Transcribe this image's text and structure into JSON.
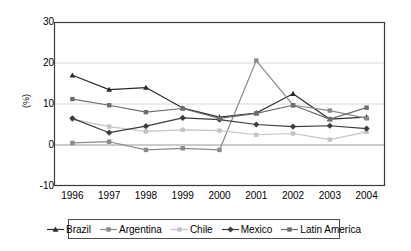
{
  "chart_data": {
    "type": "line",
    "title": "",
    "xlabel": "",
    "ylabel": "(%)",
    "categories": [
      "1996",
      "1997",
      "1998",
      "1999",
      "2000",
      "2001",
      "2002",
      "2003",
      "2004"
    ],
    "ylim": [
      -10,
      30
    ],
    "yticks": [
      "30",
      "20",
      "10",
      "0",
      "-10"
    ],
    "ytick_values": [
      30,
      20,
      10,
      0,
      -10
    ],
    "grid": true,
    "legend_position": "bottom",
    "series": [
      {
        "name": "Brazil",
        "color": "#2b2b2b",
        "marker": "triangle",
        "values": [
          17.0,
          13.5,
          14.0,
          9.0,
          6.8,
          7.8,
          12.5,
          6.3,
          6.8
        ]
      },
      {
        "name": "Argentina",
        "color": "#8a8a8a",
        "marker": "square",
        "values": [
          0.5,
          0.8,
          -1.2,
          -0.8,
          -1.2,
          20.6,
          9.7,
          8.4,
          6.5
        ]
      },
      {
        "name": "Chile",
        "color": "#c4c4c4",
        "marker": "square",
        "values": [
          6.3,
          4.5,
          3.3,
          3.7,
          3.5,
          2.5,
          2.8,
          1.3,
          3.2
        ]
      },
      {
        "name": "Mexico",
        "color": "#3c3c3c",
        "marker": "diamond",
        "values": [
          6.5,
          3.0,
          4.6,
          6.6,
          6.2,
          5.0,
          4.5,
          4.7,
          4.0
        ]
      },
      {
        "name": "Latin America",
        "color": "#6e6e6e",
        "marker": "square",
        "values": [
          11.2,
          9.7,
          8.0,
          8.9,
          6.5,
          7.7,
          9.7,
          6.3,
          9.1
        ]
      }
    ]
  },
  "legend": {
    "items": [
      {
        "label": "Brazil"
      },
      {
        "label": "Argentina"
      },
      {
        "label": "Chile"
      },
      {
        "label": "Mexico"
      },
      {
        "label": "Latin America"
      }
    ]
  },
  "axes": {
    "y_title": "(%)"
  }
}
